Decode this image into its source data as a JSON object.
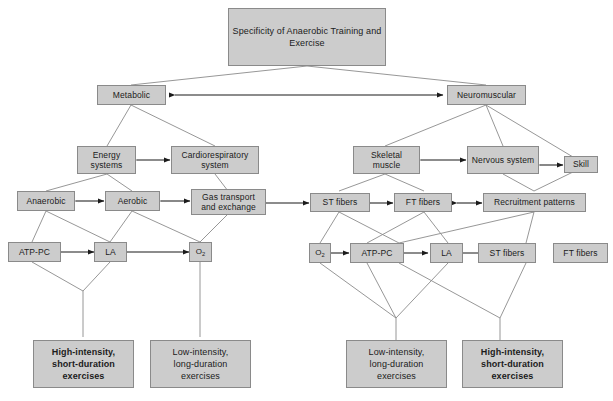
{
  "diagram": {
    "title": "Specificity of Anaerobic Training and Exercise",
    "type": "hierarchical-flow-chart",
    "colors": {
      "node_fill": "#cccccc",
      "node_border": "#8a8a8a",
      "edge": "#7d7d7d",
      "arrow": "#1b1b1b",
      "text": "#1b1b1b",
      "background": "#ffffff"
    },
    "nodes": {
      "root": {
        "label": "Specificity of Anaerobic Training and Exercise"
      },
      "metabolic": {
        "label": "Metabolic"
      },
      "neuromuscular": {
        "label": "Neuromuscular"
      },
      "energy_systems": {
        "label": "Energy systems"
      },
      "cardioresp": {
        "label": "Cardiorespiratory system"
      },
      "skeletal_muscle": {
        "label": "Skeletal muscle"
      },
      "nervous_system": {
        "label": "Nervous system"
      },
      "skill": {
        "label": "Skill"
      },
      "anaerobic": {
        "label": "Anaerobic"
      },
      "aerobic": {
        "label": "Aerobic"
      },
      "gas_transport": {
        "label": "Gas transport and exchange"
      },
      "st_fibers_mid": {
        "label": "ST fibers"
      },
      "ft_fibers_mid": {
        "label": "FT fibers"
      },
      "recruitment": {
        "label": "Recruitment patterns"
      },
      "atp_pc_left": {
        "label": "ATP-PC"
      },
      "la_left": {
        "label": "LA"
      },
      "o2_left": {
        "label": "O2",
        "label_base": "O",
        "label_sub": "2"
      },
      "o2_right": {
        "label": "O2",
        "label_base": "O",
        "label_sub": "2"
      },
      "atp_pc_right": {
        "label": "ATP-PC"
      },
      "la_right": {
        "label": "LA"
      },
      "st_fibers_low": {
        "label": "ST fibers"
      },
      "ft_fibers_low": {
        "label": "FT fibers"
      },
      "leaf_high_left": {
        "line1": "High-intensity,",
        "line2": "short-duration",
        "line3": "exercises"
      },
      "leaf_low_left": {
        "line1": "Low-intensity,",
        "line2": "long-duration",
        "line3": "exercises"
      },
      "leaf_low_right": {
        "line1": "Low-intensity,",
        "line2": "long-duration",
        "line3": "exercises"
      },
      "leaf_high_right": {
        "line1": "High-intensity,",
        "line2": "short-duration",
        "line3": "exercises"
      }
    },
    "bidirectional_arrows": [
      {
        "from": "metabolic",
        "to": "neuromuscular"
      },
      {
        "from": "energy_systems",
        "to": "cardioresp"
      },
      {
        "from": "skeletal_muscle",
        "to": "nervous_system"
      },
      {
        "from": "nervous_system",
        "to": "skill"
      },
      {
        "from": "anaerobic",
        "to": "aerobic"
      },
      {
        "from": "aerobic",
        "to": "gas_transport"
      },
      {
        "from": "gas_transport",
        "to": "st_fibers_mid"
      },
      {
        "from": "st_fibers_mid",
        "to": "ft_fibers_mid"
      },
      {
        "from": "ft_fibers_mid",
        "to": "recruitment"
      },
      {
        "from": "atp_pc_left",
        "to": "la_left"
      },
      {
        "from": "la_left",
        "to": "o2_left"
      },
      {
        "from": "o2_right",
        "to": "atp_pc_right"
      },
      {
        "from": "atp_pc_right",
        "to": "la_right"
      },
      {
        "from": "st_fibers_low",
        "to": "ft_fibers_low"
      }
    ]
  }
}
